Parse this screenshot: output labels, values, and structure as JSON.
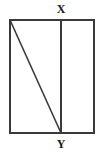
{
  "figure": {
    "type": "geometry-diagram",
    "background_color": "#ffffff",
    "stroke_color": "#3a3a3a",
    "label_color": "#1a1a1a",
    "canvas": {
      "width": 103,
      "height": 156
    },
    "rectangle": {
      "name": "outer-rectangle",
      "left": 10,
      "top": 20,
      "right": 94,
      "bottom": 133,
      "width": 84,
      "height": 113,
      "stroke_width": 1.6
    },
    "points": [
      {
        "id": "X",
        "label": "X",
        "x": 61,
        "y": 20,
        "position": "top-edge"
      },
      {
        "id": "Y",
        "label": "Y",
        "x": 61,
        "y": 133,
        "position": "bottom-edge"
      }
    ],
    "segments": [
      {
        "name": "vertical-segment-xy",
        "from": "X",
        "to": "Y",
        "x1": 61,
        "y1": 20,
        "x2": 61,
        "y2": 133,
        "stroke_width": 1.6
      },
      {
        "name": "diagonal-segment-to-y",
        "from": "top-left-corner",
        "to": "Y",
        "x1": 10,
        "y1": 20,
        "x2": 61,
        "y2": 133,
        "stroke_width": 1.6
      }
    ],
    "labels": {
      "x_label": "X",
      "y_label": "Y"
    }
  }
}
